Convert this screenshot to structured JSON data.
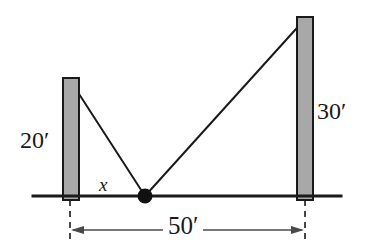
{
  "figure": {
    "type": "geometry-diagram",
    "background_color": "#ffffff",
    "line_color": "#1a1a1a",
    "pole_fill_color": "#a8a8a8",
    "labels": {
      "left_pole_height": "20′",
      "right_pole_height": "30′",
      "ground_span": "50′",
      "unknown_distance": "x"
    },
    "geometry": {
      "ground_line": {
        "x1": 33,
        "y1": 196,
        "x2": 341,
        "y2": 196
      },
      "left_pole": {
        "x": 63,
        "y": 78,
        "width": 16,
        "height": 122
      },
      "right_pole": {
        "x": 297,
        "y": 17,
        "width": 16,
        "height": 183
      },
      "stake_point": {
        "cx": 145,
        "cy": 196,
        "r": 7
      },
      "left_wire": {
        "x1": 70,
        "y1": 80,
        "x2": 145,
        "y2": 196
      },
      "right_wire": {
        "x1": 305,
        "y1": 19,
        "x2": 145,
        "y2": 196
      },
      "dimension_line": {
        "x1": 70,
        "y1": 230,
        "x2": 305,
        "y2": 230
      },
      "extension_left": {
        "x": 70,
        "y1": 200,
        "y2": 243
      },
      "extension_right": {
        "x": 305,
        "y1": 200,
        "y2": 243
      }
    }
  }
}
